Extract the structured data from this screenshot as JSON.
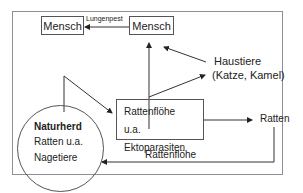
{
  "diagram": {
    "nodes": {
      "mensch_left": "Mensch",
      "mensch_right": "Mensch",
      "haustiere_line1": "Haustiere",
      "haustiere_line2": "(Katze, Kamel)",
      "naturherd_title": "Naturherd",
      "naturherd_line2": "Ratten u.a.",
      "naturherd_line3": "Nagetiere",
      "rattenfloehe_line1": "Rattenflöhe",
      "rattenfloehe_line2": "u.a. Ektoparasiten",
      "ratten": "Ratten"
    },
    "edges": {
      "lungenpest": "Lungenpest",
      "rattenfloehe_bottom": "Rattenflöhe"
    }
  }
}
